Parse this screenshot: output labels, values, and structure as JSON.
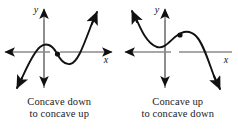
{
  "figure": {
    "panels": [
      {
        "id": "left",
        "axis_x_label": "x",
        "axis_y_label": "y",
        "caption_line1": "Concave down",
        "caption_line2": "to concave up",
        "inflection_marker": "filled-dot",
        "curve_description": "cubic rising from lower left, local maximum left of center, inflection point, local minimum, rising to upper right"
      },
      {
        "id": "right",
        "axis_x_label": "x",
        "axis_y_label": "y",
        "caption_line1": "Concave up",
        "caption_line2": "to concave down",
        "inflection_marker": "filled-dot",
        "curve_description": "cubic falling from upper left, local minimum left of center, inflection point, local maximum, falling to lower right"
      }
    ],
    "colors": {
      "axis": "#8a8a8a",
      "curve": "#111111",
      "arrowhead": "#111111",
      "text": "#1a1a1a",
      "background": "#ffffff"
    }
  }
}
